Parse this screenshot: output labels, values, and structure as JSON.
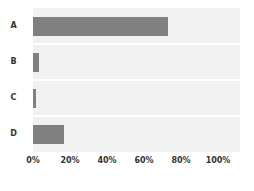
{
  "chart_data": {
    "type": "bar",
    "orientation": "horizontal",
    "title": "",
    "subtitle": "",
    "xlabel": "",
    "ylabel": "",
    "categories": [
      "A",
      "B",
      "C",
      "D"
    ],
    "values": [
      73,
      3,
      1.5,
      17
    ],
    "xlim": [
      0,
      100
    ],
    "xticks": [
      0,
      20,
      40,
      60,
      80,
      100
    ],
    "xtick_labels": [
      "0%",
      "20%",
      "40%",
      "60%",
      "80%",
      "100%"
    ],
    "grid": false,
    "legend": false,
    "legend_position": "none",
    "bar_color": "#808080",
    "plot_background": "#f1f1f1",
    "band_separator_color": "#ffffff",
    "page_background": "#ffffff",
    "tick_label_color": "#333333",
    "category_label_color": "#333333"
  }
}
